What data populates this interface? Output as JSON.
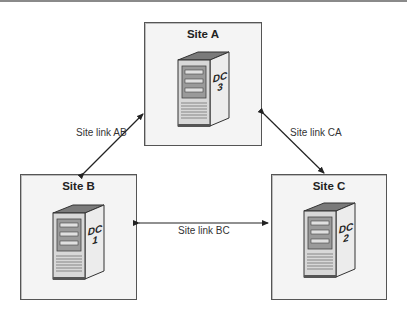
{
  "diagram": {
    "sites": [
      {
        "id": "A",
        "title": "Site A",
        "dc_label": "DC",
        "dc_number": "3"
      },
      {
        "id": "B",
        "title": "Site B",
        "dc_label": "DC",
        "dc_number": "1"
      },
      {
        "id": "C",
        "title": "Site C",
        "dc_label": "DC",
        "dc_number": "2"
      }
    ],
    "links": [
      {
        "id": "AB",
        "label": "Site link AB",
        "from": "B",
        "to": "A"
      },
      {
        "id": "CA",
        "label": "Site link CA",
        "from": "C",
        "to": "A"
      },
      {
        "id": "BC",
        "label": "Site link BC",
        "from": "B",
        "to": "C"
      }
    ],
    "colors": {
      "box_fill": "#f4f4f4",
      "box_border": "#555555",
      "server_front": "#d8d8d8",
      "server_side": "#ececec",
      "server_top": "#7a7a7a",
      "arrow": "#222222"
    }
  }
}
